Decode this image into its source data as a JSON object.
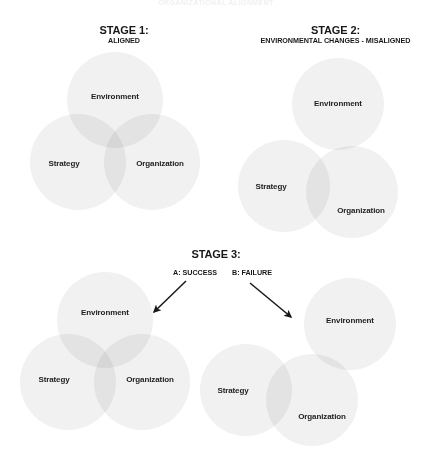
{
  "page": {
    "title_faded": "ORGANIZATIONAL ALIGNMENT",
    "background": "#ffffff",
    "circle_fill": "#f1f1f1",
    "overlap_fill": "#e4e4e4",
    "text_color": "#17181a"
  },
  "stages": {
    "stage1": {
      "heading": "STAGE 1:",
      "subheading": "ALIGNED",
      "labels": {
        "environment": "Environment",
        "strategy": "Strategy",
        "organization": "Organization"
      }
    },
    "stage2": {
      "heading": "STAGE 2:",
      "subheading": "ENVIRONMENTAL CHANGES - MISALIGNED",
      "labels": {
        "environment": "Environment",
        "strategy": "Strategy",
        "organization": "Organization"
      }
    },
    "stage3": {
      "heading": "STAGE 3:",
      "branch_a": "A: SUCCESS",
      "branch_b": "B: FAILURE",
      "success": {
        "labels": {
          "environment": "Environment",
          "strategy": "Strategy",
          "organization": "Organization"
        }
      },
      "failure": {
        "labels": {
          "environment": "Environment",
          "strategy": "Strategy",
          "organization": "Organization"
        }
      }
    }
  }
}
